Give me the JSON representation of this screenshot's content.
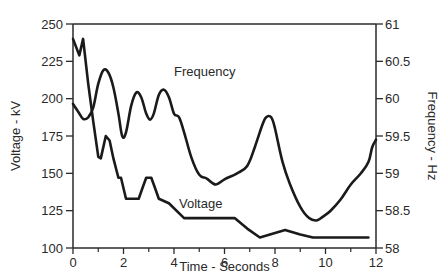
{
  "chart_data": {
    "type": "line",
    "title": "",
    "xlabel": "Time - Seconds",
    "ylabel": "Voltage - kV",
    "y2label": "Frequency - Hz",
    "xlim": [
      0,
      12
    ],
    "ylim": [
      100,
      250
    ],
    "y2lim": [
      58,
      61
    ],
    "grid": false,
    "legend": "inline labels",
    "x_ticks": [
      "0",
      "2",
      "4",
      "6",
      "8",
      "10",
      "12"
    ],
    "x_minor_ticks": [
      1,
      3,
      5,
      7,
      9,
      11
    ],
    "y_ticks": [
      "100",
      "125",
      "150",
      "175",
      "200",
      "225",
      "250"
    ],
    "y2_ticks": [
      "58",
      "58.5",
      "59",
      "59.5",
      "60",
      "60.5",
      "61"
    ],
    "series": [
      {
        "name": "Voltage",
        "axis": "left",
        "label": "Voltage",
        "label_pos": {
          "x": 4.2,
          "y": 127
        },
        "x": [
          0,
          0.25,
          0.4,
          0.6,
          0.8,
          1.0,
          1.1,
          1.3,
          1.45,
          1.6,
          1.8,
          1.9,
          2.0,
          2.1,
          2.6,
          2.75,
          2.9,
          3.1,
          3.25,
          3.4,
          3.8,
          4.4,
          5.0,
          6.0,
          6.4,
          6.9,
          7.4,
          7.9,
          8.4,
          9.0,
          9.5,
          10.5,
          11.7
        ],
        "values": [
          240,
          229,
          240,
          210,
          185,
          161,
          160,
          175,
          172,
          160,
          147,
          147,
          140,
          133,
          133,
          140,
          147,
          147,
          140,
          133,
          130,
          120,
          120,
          120,
          120,
          113,
          107,
          109.5,
          112,
          109,
          107,
          107,
          107
        ]
      },
      {
        "name": "Frequency",
        "axis": "right",
        "label": "Frequency",
        "label_pos": {
          "x": 4.0,
          "y2": 60.3
        },
        "x": [
          0,
          0.2,
          0.4,
          0.6,
          0.8,
          1.0,
          1.2,
          1.4,
          1.6,
          1.8,
          1.95,
          2.1,
          2.3,
          2.5,
          2.7,
          2.9,
          3.05,
          3.2,
          3.4,
          3.6,
          3.8,
          4.0,
          4.2,
          4.4,
          4.7,
          5.0,
          5.3,
          5.65,
          6.0,
          6.5,
          6.9,
          7.2,
          7.5,
          7.65,
          7.85,
          8.0,
          8.3,
          8.6,
          9.0,
          9.35,
          9.65,
          9.9,
          10.2,
          10.6,
          11.0,
          11.4,
          11.7,
          11.85,
          12.0
        ],
        "values": [
          59.93,
          59.83,
          59.73,
          59.75,
          59.88,
          60.2,
          60.38,
          60.35,
          60.15,
          59.8,
          59.5,
          59.55,
          59.9,
          60.08,
          60.02,
          59.8,
          59.72,
          59.8,
          60.05,
          60.12,
          60.02,
          59.8,
          59.75,
          59.55,
          59.2,
          58.98,
          58.93,
          58.85,
          58.92,
          59.0,
          59.1,
          59.35,
          59.65,
          59.75,
          59.75,
          59.6,
          59.15,
          58.85,
          58.55,
          58.4,
          58.37,
          58.42,
          58.5,
          58.65,
          58.85,
          59.0,
          59.15,
          59.35,
          59.45
        ]
      }
    ]
  },
  "labels": {
    "x_axis_title": "Time - Seconds",
    "y_axis_title": "Voltage - kV",
    "y2_axis_title": "Frequency - Hz",
    "voltage_series_label": "Voltage",
    "frequency_series_label": "Frequency"
  },
  "colors": {
    "line": "#1a1a1a",
    "axis": "#2a2a2a",
    "text": "#2a2a2a",
    "background": "#ffffff"
  }
}
